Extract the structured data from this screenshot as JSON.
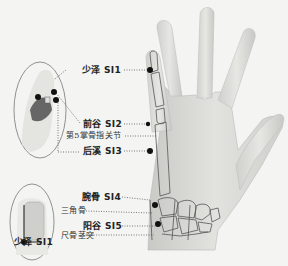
{
  "diagram": {
    "points": [
      {
        "id": "SI1",
        "label": "少泽 SI1"
      },
      {
        "id": "SI2",
        "label": "前谷 SI2"
      },
      {
        "id": "SI3",
        "label": "后溪 SI3"
      },
      {
        "id": "SI4",
        "label": "腕骨 SI4"
      },
      {
        "id": "SI5",
        "label": "阳谷 SI5"
      }
    ],
    "anatomy_labels": {
      "mcp_joint": "第5掌骨指关节",
      "triquetrum": "三角骨",
      "ulnar_styloid": "尺骨茎突"
    },
    "inset_bottom_label": "少泽 SI1",
    "colors": {
      "background": "#f4f4f2",
      "skin": "#d9d9d6",
      "outline": "#555555",
      "point": "#111111",
      "leader": "#444444"
    }
  }
}
